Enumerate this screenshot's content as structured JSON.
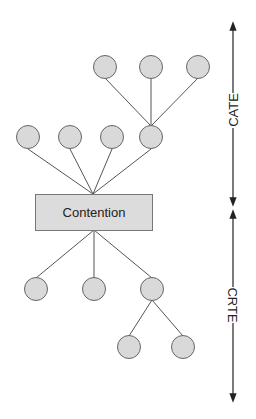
{
  "diagram": {
    "center_box": {
      "label": "Contention",
      "fill": "#dcdcdc"
    },
    "node_fill": "#d9d9d9",
    "stroke": "#555555",
    "axis": {
      "upper_label": "CATE",
      "lower_label": "CRTE"
    },
    "upper_tree": {
      "level1_count": 4,
      "level2_count": 3,
      "level2_parent_index": 3
    },
    "lower_tree": {
      "level1_count": 3,
      "level2_count": 2,
      "level2_parent_index": 2
    }
  }
}
